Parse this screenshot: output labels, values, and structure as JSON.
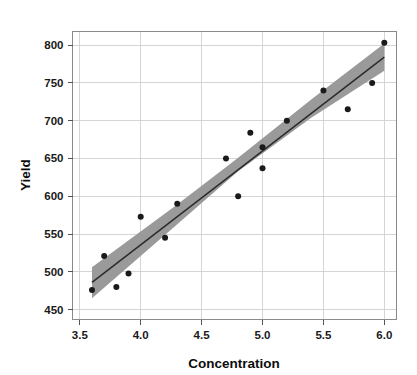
{
  "chart_data": {
    "type": "scatter",
    "title": "",
    "subtitle": "",
    "xlabel": "Concentration",
    "ylabel": "Yield",
    "xlim": [
      3.44,
      6.1
    ],
    "ylim": [
      437,
      818
    ],
    "xticks": [
      3.5,
      4.0,
      4.5,
      5.0,
      5.5,
      6.0
    ],
    "xtick_labels": [
      "3.5",
      "4.0",
      "4.5",
      "5.0",
      "5.5",
      "6.0"
    ],
    "yticks": [
      450,
      500,
      550,
      600,
      650,
      700,
      750,
      800
    ],
    "ytick_labels": [
      "450",
      "500",
      "550",
      "600",
      "650",
      "700",
      "750",
      "800"
    ],
    "grid": true,
    "legend": "none",
    "x": [
      3.6,
      3.7,
      3.8,
      3.9,
      4.0,
      4.2,
      4.3,
      4.7,
      4.8,
      4.9,
      5.0,
      5.0,
      5.2,
      5.5,
      5.7,
      5.9,
      6.0
    ],
    "y": [
      476,
      521,
      480,
      498,
      573,
      545,
      590,
      650,
      600,
      684,
      665,
      637,
      700,
      740,
      715,
      750,
      803
    ],
    "points": [
      {
        "x": 3.6,
        "y": 476
      },
      {
        "x": 3.7,
        "y": 521
      },
      {
        "x": 3.8,
        "y": 480
      },
      {
        "x": 3.9,
        "y": 498
      },
      {
        "x": 4.0,
        "y": 573
      },
      {
        "x": 4.2,
        "y": 545
      },
      {
        "x": 4.3,
        "y": 590
      },
      {
        "x": 4.7,
        "y": 650
      },
      {
        "x": 4.8,
        "y": 600
      },
      {
        "x": 4.9,
        "y": 684
      },
      {
        "x": 5.0,
        "y": 665
      },
      {
        "x": 5.0,
        "y": 637
      },
      {
        "x": 5.2,
        "y": 700
      },
      {
        "x": 5.5,
        "y": 740
      },
      {
        "x": 5.7,
        "y": 715
      },
      {
        "x": 5.9,
        "y": 750
      },
      {
        "x": 6.0,
        "y": 803
      }
    ],
    "fit_line": {
      "type": "linear-regression",
      "x_start": 3.6,
      "y_start": 486,
      "x_end": 6.0,
      "y_end": 784,
      "slope": 124.2,
      "intercept": 38.8
    },
    "confidence_band": {
      "label": "confidence interval",
      "color": "#9a9a9a",
      "upper": [
        {
          "x": 3.6,
          "y": 506
        },
        {
          "x": 4.3,
          "y": 589
        },
        {
          "x": 4.8,
          "y": 651
        },
        {
          "x": 5.4,
          "y": 728
        },
        {
          "x": 6.0,
          "y": 802
        }
      ],
      "lower": [
        {
          "x": 3.6,
          "y": 465
        },
        {
          "x": 4.3,
          "y": 563
        },
        {
          "x": 4.8,
          "y": 633
        },
        {
          "x": 5.4,
          "y": 704
        },
        {
          "x": 6.0,
          "y": 766
        }
      ]
    },
    "colors": {
      "point": "#1a1a1a",
      "line": "#2b2b2b",
      "band": "#9a9a9a",
      "grid": "#d0d0d0",
      "frame": "#8a8a8a",
      "text": "#0d0d0d"
    }
  }
}
